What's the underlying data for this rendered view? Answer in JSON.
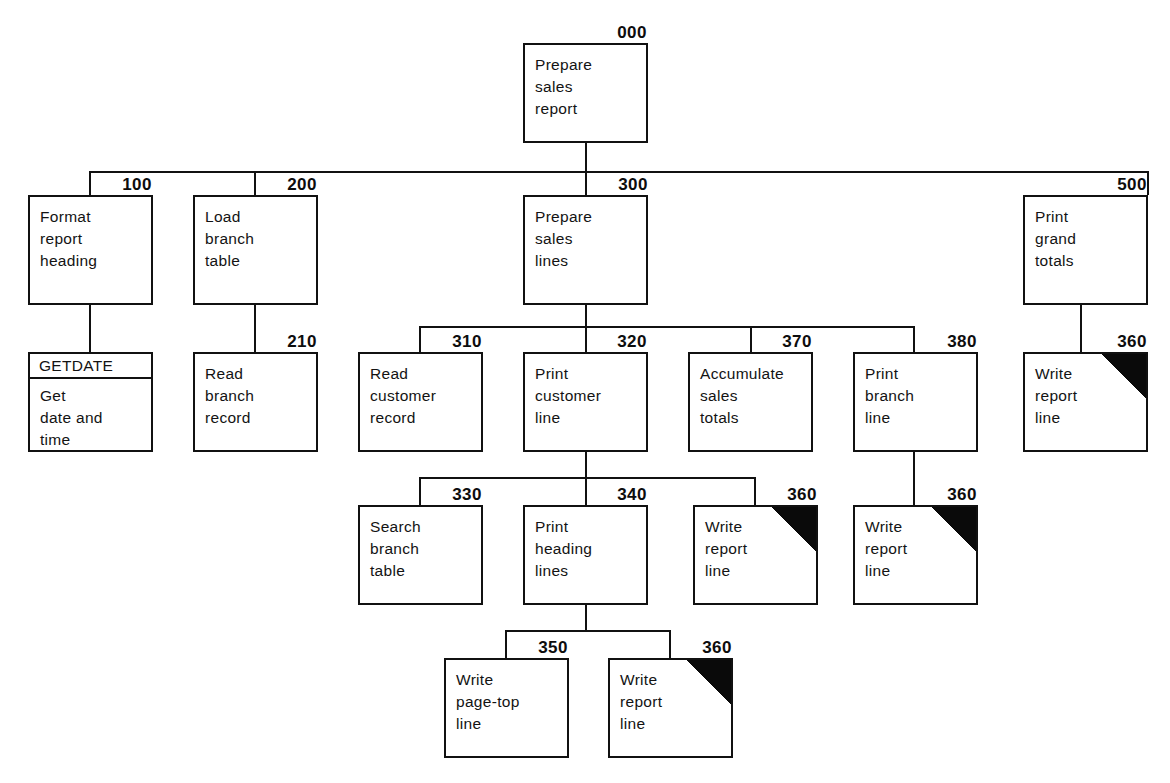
{
  "diagram": {
    "type": "structure-chart",
    "line_color": "#111111",
    "box_fill": "#ffffff",
    "flag_color": "#0a0a0a",
    "flag_meaning": "black-corner-triangle marks a repeated/common module"
  },
  "modules": {
    "m000": {
      "ref": "000",
      "text": "Prepare\nsales\nreport"
    },
    "m100": {
      "ref": "100",
      "text": "Format\nreport\nheading"
    },
    "m200": {
      "ref": "200",
      "text": "Load\nbranch\ntable"
    },
    "m300": {
      "ref": "300",
      "text": "Prepare\nsales\nlines"
    },
    "m500": {
      "ref": "500",
      "text": "Print\ngrand\ntotals"
    },
    "getdate": {
      "ref": "",
      "banner": "GETDATE",
      "text": "Get\ndate and\ntime"
    },
    "m210": {
      "ref": "210",
      "text": "Read\nbranch\nrecord"
    },
    "m310": {
      "ref": "310",
      "text": "Read\ncustomer\nrecord"
    },
    "m320": {
      "ref": "320",
      "text": "Print\ncustomer\nline"
    },
    "m370": {
      "ref": "370",
      "text": "Accumulate\nsales\ntotals"
    },
    "m380": {
      "ref": "380",
      "text": "Print\nbranch\nline"
    },
    "m360a": {
      "ref": "360",
      "text": "Write\nreport\nline"
    },
    "m330": {
      "ref": "330",
      "text": "Search\nbranch\ntable"
    },
    "m340": {
      "ref": "340",
      "text": "Print\nheading\nlines"
    },
    "m360b": {
      "ref": "360",
      "text": "Write\nreport\nline"
    },
    "m360c": {
      "ref": "360",
      "text": "Write\nreport\nline"
    },
    "m350": {
      "ref": "350",
      "text": "Write\npage-top\nline"
    },
    "m360d": {
      "ref": "360",
      "text": "Write\nreport\nline"
    }
  }
}
